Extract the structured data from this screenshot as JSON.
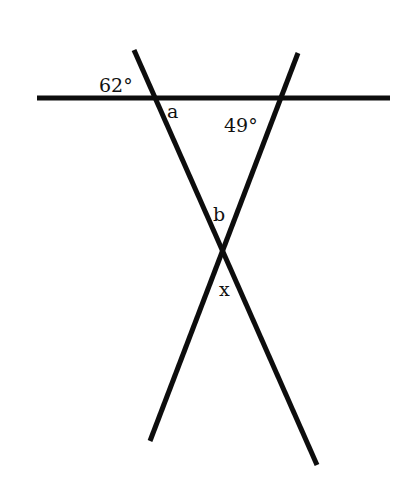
{
  "diagram": {
    "type": "geometry-angles",
    "labels": {
      "angle_top_left": "62°",
      "angle_a": "a",
      "angle_right": "49°",
      "angle_b": "b",
      "angle_x": "x"
    },
    "line_color": "#0d0d0d",
    "label_color": "#111111"
  }
}
